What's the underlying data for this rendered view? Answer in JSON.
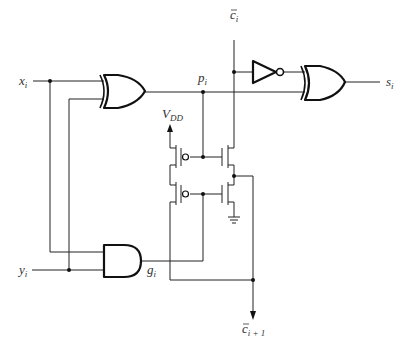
{
  "diagram": {
    "type": "circuit-schematic",
    "labels": {
      "x_input": {
        "base": "x",
        "sub": "i"
      },
      "y_input": {
        "base": "y",
        "sub": "i"
      },
      "c_input": {
        "base": "c",
        "sub": "i",
        "overbar": true
      },
      "p_node": {
        "base": "p",
        "sub": "i"
      },
      "g_node": {
        "base": "g",
        "sub": "i"
      },
      "s_output": {
        "base": "s",
        "sub": "i"
      },
      "c_output": {
        "base": "c",
        "sub": "i + 1",
        "overbar": true
      },
      "vdd": {
        "base": "V",
        "sub": "DD"
      }
    },
    "components": [
      {
        "id": "xor1",
        "type": "XOR",
        "inputs": [
          "x_i",
          "y_i"
        ],
        "output": "p_i"
      },
      {
        "id": "and1",
        "type": "AND",
        "inputs": [
          "x_i",
          "y_i"
        ],
        "output": "g_i"
      },
      {
        "id": "inv1",
        "type": "NOT",
        "inputs": [
          "c̄_i"
        ],
        "output": "c_i"
      },
      {
        "id": "xor2",
        "type": "XOR",
        "inputs": [
          "c_i",
          "p_i"
        ],
        "output": "s_i"
      },
      {
        "id": "pmos1",
        "type": "PMOS",
        "gate": "p_i"
      },
      {
        "id": "pmos2",
        "type": "PMOS",
        "gate": "g_i"
      },
      {
        "id": "nmos1",
        "type": "NMOS",
        "gate": "p_i"
      },
      {
        "id": "nmos2",
        "type": "NMOS",
        "gate": "g_i"
      },
      {
        "id": "gnd",
        "type": "ground"
      }
    ]
  }
}
